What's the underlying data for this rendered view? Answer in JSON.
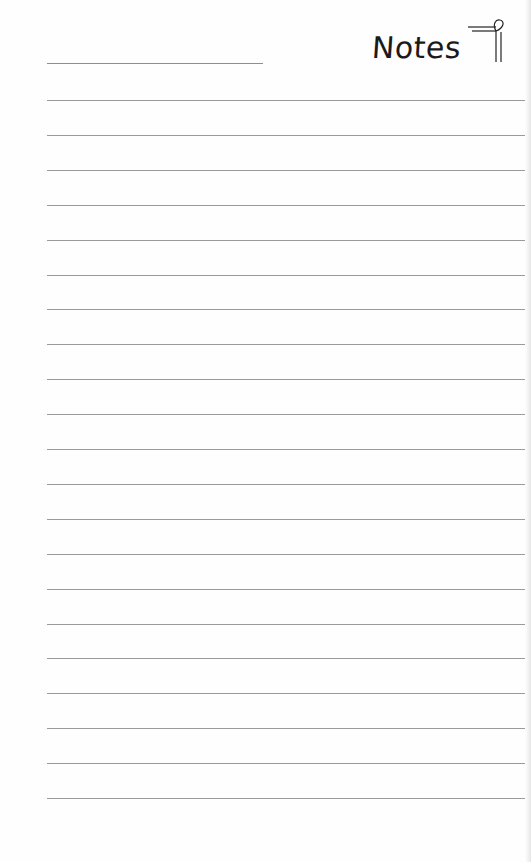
{
  "page": {
    "title": "Notes",
    "logo_icon": "paragraph-mark-icon",
    "header_line": {
      "x": 47,
      "y": 63,
      "width": 216
    },
    "ruled_lines": {
      "count": 21,
      "start_y": 100,
      "spacing": 34.9,
      "x": 47,
      "width": 478,
      "color": "#9a9a9a"
    }
  }
}
